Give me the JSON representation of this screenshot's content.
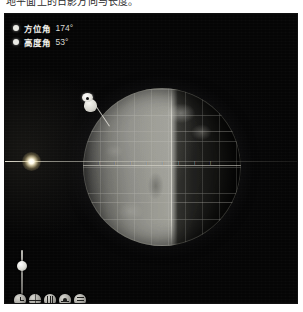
{
  "caption": "地平面上的日影方向与长度。",
  "panel": {
    "name": "sun-position-globe-viewer",
    "background_color": "#050505"
  },
  "legend": {
    "items": [
      {
        "icon": "filled-circle-icon",
        "label": "方位角",
        "value": "174°",
        "color": "#e9e9e4"
      },
      {
        "icon": "filled-circle-icon",
        "label": "高度角",
        "value": "53°",
        "color": "#e9e9e4"
      }
    ]
  },
  "scene": {
    "sun_label": "sun-light-source",
    "horizon_label": "horizon-ray-line",
    "globe_label": "earth-globe",
    "marker_label": "observer-marker",
    "equator_ticks": [
      "|",
      "|",
      "|",
      "|",
      "|",
      "|",
      "|",
      "|"
    ]
  },
  "slider": {
    "name": "zoom-slider",
    "orientation": "vertical",
    "value": "75"
  },
  "toolbar": {
    "buttons": [
      {
        "icon": "clock-icon",
        "label": "时间"
      },
      {
        "icon": "globe-icon",
        "label": "地球"
      },
      {
        "icon": "grid-icon",
        "label": "网格"
      },
      {
        "icon": "terrain-icon",
        "label": "地形"
      },
      {
        "icon": "layers-icon",
        "label": "图层"
      }
    ]
  }
}
